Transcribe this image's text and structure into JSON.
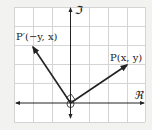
{
  "diagram": {
    "colors": {
      "background": "#f2f2f0",
      "grid_bg": "#ffffff",
      "grid": "#d4d4d4",
      "axis": "#222222",
      "vector": "#222222"
    },
    "axes": {
      "x_label": "ℜ",
      "y_label": "ℑ"
    },
    "points": [
      {
        "name": "P",
        "label": "P(x, y)"
      },
      {
        "name": "P_prime",
        "label": "P′(−y, x)"
      }
    ],
    "markers": {
      "origin": "circle",
      "right_angle": "diamond"
    }
  }
}
